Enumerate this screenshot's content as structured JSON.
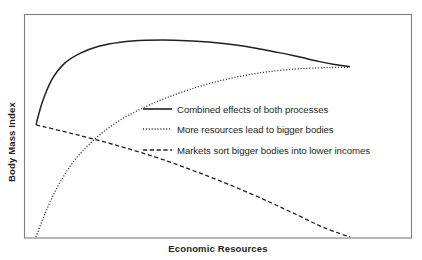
{
  "figure": {
    "background": "#ffffff",
    "frame_color": "#7f7f7f",
    "ink_color": "#231f20"
  },
  "chart_data": {
    "type": "line",
    "title": "",
    "subtitle": "",
    "xlabel": "Economic Resources",
    "ylabel": "Body Mass Index",
    "xlim": [
      0,
      100
    ],
    "ylim": [
      0,
      100
    ],
    "grid": false,
    "axis_ticks": false,
    "axis_tick_labels": false,
    "legend_position": "center",
    "annotations": [],
    "series": [
      {
        "name": "Combined effects of both processes",
        "style": "solid",
        "stroke_width": 1.5,
        "x": [
          0,
          2,
          5,
          9,
          14,
          20,
          27,
          35,
          44,
          55,
          66,
          77,
          84,
          90,
          95,
          100
        ],
        "y": [
          55,
          66,
          77,
          85,
          90,
          93.5,
          95.5,
          96.4,
          96.5,
          95.6,
          93.6,
          90.5,
          88.2,
          86.1,
          84.6,
          83.5
        ]
      },
      {
        "name": "More resources lead to bigger bodies",
        "style": "dotted",
        "stroke_width": 1.3,
        "x": [
          0,
          3,
          7,
          12,
          18,
          25,
          33,
          42,
          52,
          62,
          72,
          82,
          90,
          95,
          100
        ],
        "y": [
          0,
          12,
          25,
          37,
          47,
          55.5,
          62.5,
          68.5,
          73.8,
          77.8,
          80.6,
          82.3,
          82.9,
          83.1,
          83.2
        ]
      },
      {
        "name": "Markets sort bigger bodies into lower incomes",
        "style": "dashed",
        "stroke_width": 1.3,
        "x": [
          0,
          12,
          25,
          38,
          50,
          62,
          74,
          84,
          92,
          100
        ],
        "y": [
          55,
          50.5,
          45.2,
          39.2,
          32.6,
          25.4,
          17.4,
          10.2,
          4.4,
          0
        ]
      }
    ]
  },
  "legend": {
    "entries": [
      {
        "label": "Combined effects of both processes",
        "style": "solid"
      },
      {
        "label": "More resources lead to bigger bodies",
        "style": "dotted"
      },
      {
        "label": "Markets sort bigger bodies into lower incomes",
        "style": "dashed"
      }
    ]
  }
}
